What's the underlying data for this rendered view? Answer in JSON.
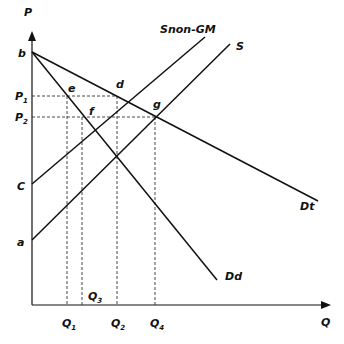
{
  "diagram": {
    "type": "supply-demand",
    "axes": {
      "y_label": "P",
      "x_label": "Q"
    },
    "price_labels": {
      "p1": "P",
      "p1_sub": "1",
      "p2": "P",
      "p2_sub": "2"
    },
    "quantity_labels": {
      "q1": "Q",
      "q1_sub": "1",
      "q2": "Q",
      "q2_sub": "2",
      "q3": "Q",
      "q3_sub": "3",
      "q4": "Q",
      "q4_sub": "4"
    },
    "intercept_labels": {
      "b": "b",
      "c": "C",
      "a": "a"
    },
    "point_labels": {
      "d": "d",
      "e": "e",
      "f": "f",
      "g": "g"
    },
    "curve_labels": {
      "snon_gm": "Snon-GM",
      "s": "S",
      "dt": "Dt",
      "dd": "Dd"
    },
    "colors": {
      "line": "#111111",
      "dashed": "#333333",
      "background": "#ffffff"
    }
  }
}
